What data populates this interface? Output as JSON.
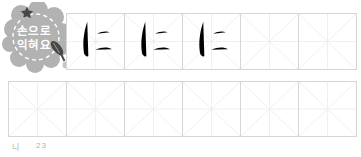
{
  "badge": {
    "line1": "손으로",
    "line2": "익혀요",
    "bg_color": "#b2b2b2",
    "text_color": "#ffffff",
    "icon_color": "#474747",
    "ink_blob_color": "#c6c6c6",
    "icons": {
      "star": "star-icon",
      "pen": "brush-pen-icon",
      "blob": "ink-blob-icon"
    }
  },
  "practice": {
    "character": "に",
    "character_name": "hiragana-ni",
    "grid": {
      "border_color": "#d6d6d6",
      "guide_color": "#f0f0f0"
    },
    "top_row": {
      "cells": [
        {
          "char": "に",
          "ink": "#1e1e1e",
          "variant": "solid-example"
        },
        {
          "char": "に",
          "ink": "#8d8d8d",
          "variant": "trace-medium"
        },
        {
          "char": "に",
          "ink": "#c9c9c9",
          "variant": "trace-light"
        },
        {
          "char": "",
          "ink": "",
          "variant": "empty"
        },
        {
          "char": "",
          "ink": "",
          "variant": "empty"
        }
      ]
    },
    "bottom_row": {
      "cells": [
        {
          "char": "",
          "ink": "",
          "variant": "empty"
        },
        {
          "char": "",
          "ink": "",
          "variant": "empty"
        },
        {
          "char": "",
          "ink": "",
          "variant": "empty"
        },
        {
          "char": "",
          "ink": "",
          "variant": "empty"
        },
        {
          "char": "",
          "ink": "",
          "variant": "empty"
        },
        {
          "char": "",
          "ink": "",
          "variant": "empty"
        }
      ]
    }
  },
  "footer": {
    "reading": "니",
    "page_number": "23",
    "color": "#b3b3b3"
  }
}
